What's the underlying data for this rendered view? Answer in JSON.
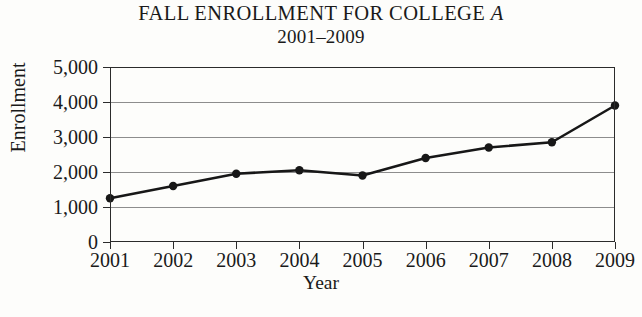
{
  "chart_data": {
    "type": "line",
    "title": "FALL ENROLLMENT FOR COLLEGE A",
    "title_main": "FALL ENROLLMENT FOR COLLEGE ",
    "title_italic": "A",
    "subtitle": "2001–2009",
    "xlabel": "Year",
    "ylabel": "Enrollment",
    "categories": [
      "2001",
      "2002",
      "2003",
      "2004",
      "2005",
      "2006",
      "2007",
      "2008",
      "2009"
    ],
    "values": [
      1250,
      1600,
      1950,
      2050,
      1900,
      2400,
      2700,
      2850,
      3900
    ],
    "series": [
      {
        "name": "Enrollment",
        "values": [
          1250,
          1600,
          1950,
          2050,
          1900,
          2400,
          2700,
          2850,
          3900
        ]
      }
    ],
    "ylim": [
      0,
      5000
    ],
    "ytick_values": [
      0,
      1000,
      2000,
      3000,
      4000,
      5000
    ],
    "ytick_labels": [
      "0",
      "1,000",
      "2,000",
      "3,000",
      "4,000",
      "5,000"
    ],
    "grid": true,
    "grid_axis": "y",
    "legend": false,
    "legend_position": "none",
    "marker": "filled-circle",
    "line_color": "#171717",
    "grid_color": "#8d8d8d",
    "axis_color": "#2b2b2b",
    "background_color": "#fdfdfb"
  }
}
